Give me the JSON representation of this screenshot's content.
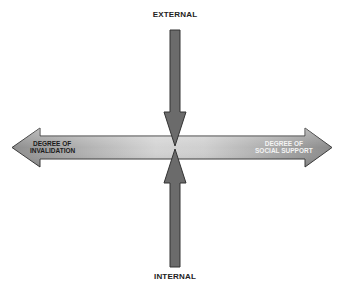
{
  "diagram": {
    "top_label": "EXTERNAL",
    "bottom_label": "INTERNAL",
    "left_label_line1": "DEGREE OF",
    "left_label_line2": "INVALIDATION",
    "right_label_line1": "DEGREE OF",
    "right_label_line2": "SOCIAL SUPPORT",
    "colors": {
      "arrow_fill": "#6a6a6a",
      "arrow_outline": "#333333",
      "gradient_dark": "#8a8a8a",
      "gradient_light": "#e8e8e8",
      "left_text": "#1a1a1a",
      "right_text": "#f4f4f4"
    }
  }
}
